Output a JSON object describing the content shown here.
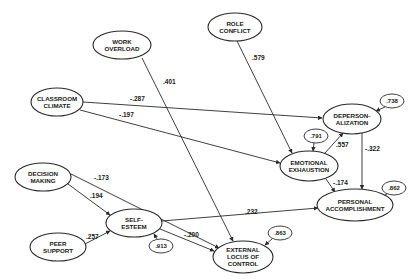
{
  "diagram": {
    "type": "path-model",
    "colors": {
      "stroke": "#2a2a2a",
      "text": "#1a1a1a",
      "background": "#ffffff"
    },
    "nodes": [
      {
        "id": "work_overload",
        "lines": [
          "WORK",
          "OVERLOAD"
        ],
        "cx": 122,
        "cy": 45,
        "rx": 29,
        "ry": 14
      },
      {
        "id": "role_conflict",
        "lines": [
          "ROLE",
          "CONFLICT"
        ],
        "cx": 235,
        "cy": 27,
        "rx": 27,
        "ry": 14
      },
      {
        "id": "classroom_climate",
        "lines": [
          "CLASSROOM",
          "CLIMATE"
        ],
        "cx": 57,
        "cy": 102,
        "rx": 26,
        "ry": 14
      },
      {
        "id": "depersonalization",
        "lines": [
          "DEPERSON-",
          "ALIZATION"
        ],
        "cx": 352,
        "cy": 119,
        "rx": 29,
        "ry": 15
      },
      {
        "id": "emotional_exhaustion",
        "lines": [
          "EMOTIONAL",
          "EXHAUSTION"
        ],
        "cx": 309,
        "cy": 166,
        "rx": 29,
        "ry": 15
      },
      {
        "id": "decision_making",
        "lines": [
          "DECISION",
          "MAKING"
        ],
        "cx": 43,
        "cy": 177,
        "rx": 28,
        "ry": 14
      },
      {
        "id": "self_esteem",
        "lines": [
          "SELF-",
          "ESTEEM"
        ],
        "cx": 134,
        "cy": 223,
        "rx": 28,
        "ry": 14
      },
      {
        "id": "peer_support",
        "lines": [
          "PEER",
          "SUPPORT"
        ],
        "cx": 58,
        "cy": 247,
        "rx": 28,
        "ry": 14
      },
      {
        "id": "external_locus",
        "lines": [
          "EXTERNAL",
          "LOCUS OF",
          "CONTROL"
        ],
        "cx": 243,
        "cy": 257,
        "rx": 30,
        "ry": 16
      },
      {
        "id": "personal_accomplishment",
        "lines": [
          "PERSONAL",
          "ACCOMPLISHMENT"
        ],
        "cx": 355,
        "cy": 205,
        "rx": 38,
        "ry": 16
      }
    ],
    "paths": [
      {
        "from": "work_overload",
        "to": "external_locus",
        "coef": ".401",
        "x1": 142,
        "y1": 58,
        "x2": 233,
        "y2": 241,
        "lx": 163,
        "ly": 84
      },
      {
        "from": "role_conflict",
        "to": "emotional_exhaustion",
        "coef": ".579",
        "x1": 237,
        "y1": 41,
        "x2": 292,
        "y2": 153,
        "lx": 252,
        "ly": 60
      },
      {
        "from": "classroom_climate",
        "to": "depersonalization",
        "coef": "-.287",
        "x1": 83,
        "y1": 102,
        "x2": 322,
        "y2": 118,
        "lx": 130,
        "ly": 101
      },
      {
        "from": "classroom_climate",
        "to": "emotional_exhaustion",
        "coef": "-.197",
        "x1": 80,
        "y1": 110,
        "x2": 280,
        "y2": 163,
        "lx": 119,
        "ly": 117
      },
      {
        "from": "emotional_exhaustion",
        "to": "depersonalization",
        "coef": ".557",
        "x1": 325,
        "y1": 153,
        "x2": 343,
        "y2": 133,
        "lx": 336,
        "ly": 147
      },
      {
        "from": "depersonalization",
        "to": "personal_accomplishment",
        "coef": "-.322",
        "x1": 362,
        "y1": 133,
        "x2": 362,
        "y2": 189,
        "lx": 365,
        "ly": 151
      },
      {
        "from": "emotional_exhaustion",
        "to": "personal_accomplishment",
        "coef": "-.174",
        "x1": 326,
        "y1": 179,
        "x2": 335,
        "y2": 192,
        "lx": 333,
        "ly": 185
      },
      {
        "from": "decision_making",
        "to": "external_locus",
        "coef": "-.173",
        "x1": 71,
        "y1": 174,
        "x2": 219,
        "y2": 248,
        "lx": 94,
        "ly": 180
      },
      {
        "from": "decision_making",
        "to": "self_esteem",
        "coef": ".194",
        "x1": 68,
        "y1": 184,
        "x2": 110,
        "y2": 215,
        "lx": 90,
        "ly": 198
      },
      {
        "from": "peer_support",
        "to": "self_esteem",
        "coef": ".257",
        "x1": 85,
        "y1": 244,
        "x2": 110,
        "y2": 231,
        "lx": 86,
        "ly": 239
      },
      {
        "from": "self_esteem",
        "to": "personal_accomplishment",
        "coef": ".232",
        "x1": 162,
        "y1": 221,
        "x2": 318,
        "y2": 208,
        "lx": 245,
        "ly": 214
      },
      {
        "from": "self_esteem",
        "to": "external_locus",
        "coef": "-.200",
        "x1": 160,
        "y1": 229,
        "x2": 214,
        "y2": 251,
        "lx": 184,
        "ly": 237
      }
    ],
    "residuals": [
      {
        "target": "depersonalization",
        "value": ".738",
        "cx": 392,
        "cy": 101,
        "rx": 12,
        "ry": 7,
        "ax1": 385,
        "ay1": 107,
        "ax2": 376,
        "ay2": 111
      },
      {
        "target": "emotional_exhaustion",
        "value": ".791",
        "cx": 316,
        "cy": 136,
        "rx": 12,
        "ry": 7,
        "ax1": 314,
        "ay1": 143,
        "ax2": 313,
        "ay2": 151
      },
      {
        "target": "personal_accomplishment",
        "value": ".862",
        "cx": 394,
        "cy": 188,
        "rx": 12,
        "ry": 7,
        "ax1": 387,
        "ay1": 194,
        "ax2": 379,
        "ay2": 198
      },
      {
        "target": "external_locus",
        "value": ".863",
        "cx": 280,
        "cy": 233,
        "rx": 12,
        "ry": 7,
        "ax1": 272,
        "ay1": 239,
        "ax2": 265,
        "ay2": 245
      },
      {
        "target": "self_esteem",
        "value": ".913",
        "cx": 161,
        "cy": 246,
        "rx": 12,
        "ry": 7,
        "ax1": 157,
        "ay1": 239,
        "ax2": 154,
        "ay2": 234
      }
    ]
  }
}
